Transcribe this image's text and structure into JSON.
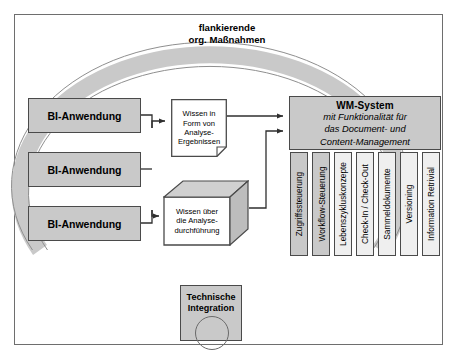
{
  "diagram": {
    "ring_label": "flankierende\norg. Maßnahmen",
    "ring_label_line1": "flankierende",
    "ring_label_line2": "org. Maßnahmen",
    "ring_color": "#c9c9c9",
    "box_fill": "#c9c9c9",
    "border_color": "#4a4a4a",
    "background": "#ffffff"
  },
  "bi_applications": [
    {
      "label": "BI-Anwendung"
    },
    {
      "label": "BI-Anwendung"
    },
    {
      "label": "BI-Anwendung"
    }
  ],
  "knowledge_document": {
    "line1": "Wissen in",
    "line2": "Form von",
    "line3": "Analyse-",
    "line4": "Ergebnissen"
  },
  "knowledge_cube": {
    "line1": "Wissen über",
    "line2": "die Analyse-",
    "line3": "durchführung"
  },
  "wm_system": {
    "title": "WM-System",
    "subtitle_line1": "mit Funktionalität für",
    "subtitle_line2": "das Document- und",
    "subtitle_line3": "Content-Management",
    "capabilities": [
      {
        "label": "Zugriffssteuerung",
        "shaded": true
      },
      {
        "label": "Workflow-Steuerung",
        "shaded": true
      },
      {
        "label": "Lebenszykluskonzepte",
        "shaded": false
      },
      {
        "label": "Check-In / Check-Out",
        "shaded": false
      },
      {
        "label": "Sammeldokumente",
        "shaded": false
      },
      {
        "label": "Versioning",
        "shaded": false
      },
      {
        "label": "Information Retrivial",
        "shaded": false
      }
    ]
  },
  "technical_integration": {
    "line1": "Technische",
    "line2": "Integration"
  }
}
